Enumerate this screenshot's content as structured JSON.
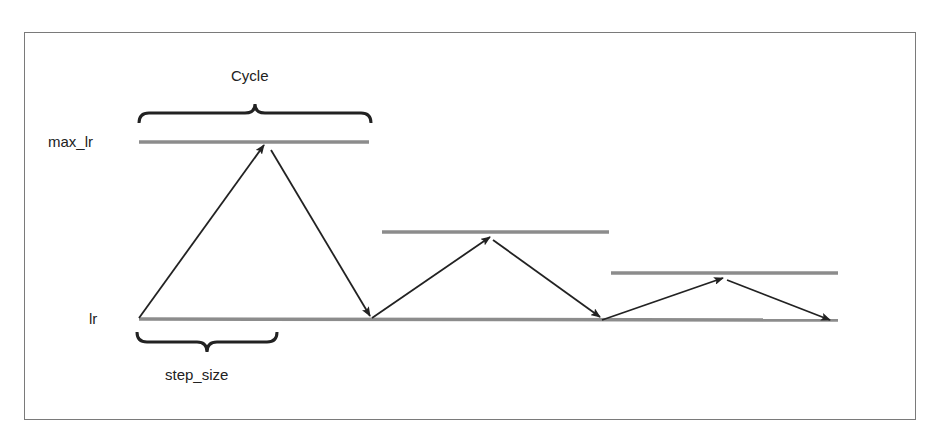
{
  "diagram": {
    "labels": {
      "cycle": "Cycle",
      "max_lr": "max_lr",
      "lr": "lr",
      "step_size": "step_size"
    },
    "colors": {
      "frame": "#7a7a7a",
      "level_line": "#8c8c8c",
      "arrow": "#222222",
      "text": "#222222"
    },
    "baseline": {
      "y": 318,
      "x_start": 139,
      "x_end": 838
    },
    "level_lines": [
      {
        "name": "max_lr",
        "y": 142,
        "x_start": 139,
        "x_end": 369
      },
      {
        "name": "peak-2",
        "y": 232,
        "x_start": 382,
        "x_end": 609
      },
      {
        "name": "peak-3",
        "y": 273,
        "x_start": 611,
        "x_end": 838
      }
    ],
    "arrows": [
      {
        "from": [
          139,
          318
        ],
        "to": [
          264,
          145
        ]
      },
      {
        "from": [
          271,
          150
        ],
        "to": [
          370,
          316
        ]
      },
      {
        "from": [
          372,
          318
        ],
        "to": [
          490,
          237
        ]
      },
      {
        "from": [
          493,
          240
        ],
        "to": [
          600,
          317
        ]
      },
      {
        "from": [
          602,
          320
        ],
        "to": [
          723,
          278
        ]
      },
      {
        "from": [
          727,
          280
        ],
        "to": [
          830,
          320
        ]
      }
    ],
    "braces": [
      {
        "name": "cycle",
        "x_start": 139,
        "x_end": 371,
        "y": 122,
        "orientation": "up"
      },
      {
        "name": "step_size",
        "x_start": 137,
        "x_end": 277,
        "y": 335,
        "orientation": "down"
      }
    ]
  }
}
